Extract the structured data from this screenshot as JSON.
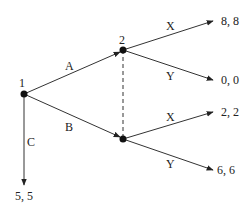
{
  "diagram": {
    "type": "extensive-form-game-tree",
    "nodes": [
      {
        "id": "n1",
        "label": "1",
        "x": 24,
        "y": 94
      },
      {
        "id": "n2",
        "label": "2",
        "x": 123,
        "y": 50
      },
      {
        "id": "n3",
        "label": "",
        "x": 123,
        "y": 139
      }
    ],
    "information_set": {
      "from": "n2",
      "to": "n3",
      "style": "dashed"
    },
    "edges": [
      {
        "from": "n1",
        "to": "n2",
        "label": "A"
      },
      {
        "from": "n1",
        "to": "n3",
        "label": "B"
      },
      {
        "from": "n1",
        "to": "t_c",
        "label": "C"
      },
      {
        "from": "n2",
        "to": "t1",
        "label": "X"
      },
      {
        "from": "n2",
        "to": "t2",
        "label": "Y"
      },
      {
        "from": "n3",
        "to": "t3",
        "label": "X"
      },
      {
        "from": "n3",
        "to": "t4",
        "label": "Y"
      }
    ],
    "payoffs": {
      "t1": "8, 8",
      "t2": "0, 0",
      "t3": "2, 2",
      "t4": "6, 6",
      "t_c": "5, 5"
    },
    "labels": {
      "player1": "1",
      "player2": "2",
      "A": "A",
      "B": "B",
      "C": "C",
      "X_upper": "X",
      "Y_upper": "Y",
      "X_lower": "X",
      "Y_lower": "Y"
    }
  }
}
